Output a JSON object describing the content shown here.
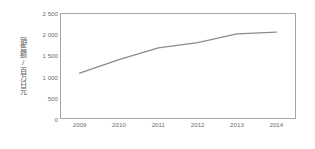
{
  "chart_data": {
    "type": "line",
    "title": "",
    "xlabel": "",
    "ylabel": "销售额/百万日元",
    "categories": [
      "2009",
      "2010",
      "2011",
      "2012",
      "2013",
      "2014"
    ],
    "values": [
      1080,
      1400,
      1680,
      1800,
      2010,
      2050
    ],
    "series": [
      {
        "name": "销售额",
        "values": [
          1080,
          1400,
          1680,
          1800,
          2010,
          2050
        ]
      }
    ],
    "ylim": [
      0,
      2500
    ],
    "ytick_labels": [
      "0",
      "500",
      "1 000",
      "1 500",
      "2 000",
      "2 500"
    ],
    "ytick_values": [
      0,
      500,
      1000,
      1500,
      2000,
      2500
    ],
    "xtick_labels": [
      "2009",
      "2010",
      "2011",
      "2012",
      "2013",
      "2014"
    ],
    "grid": false,
    "legend": false,
    "legend_position": "none",
    "line_color": "#8c8c8c",
    "axis_color": "#a6a6a6",
    "tick_text_color": "#6e6e6e",
    "background_color": "#ffffff"
  }
}
